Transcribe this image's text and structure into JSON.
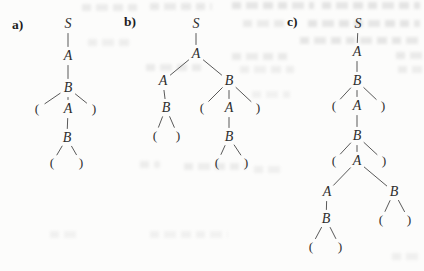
{
  "figure": {
    "type": "parse-tree-diagram",
    "description_visible": "",
    "text_color": "#2e2e2e",
    "edge_color": "#595959",
    "background_color": "#fcfcfb",
    "panels": [
      {
        "label": "a)",
        "tree": {
          "nodes": [
            {
              "id": "n1",
              "label": "S",
              "x": 68,
              "y": 24,
              "parent": ""
            },
            {
              "id": "n2",
              "label": "A",
              "x": 68,
              "y": 56,
              "parent": "n1"
            },
            {
              "id": "n3",
              "label": "B",
              "x": 68,
              "y": 88,
              "parent": "n2"
            },
            {
              "id": "n4",
              "label": "(",
              "x": 37,
              "y": 109,
              "parent": "n3"
            },
            {
              "id": "n5",
              "label": "A",
              "x": 68,
              "y": 109,
              "parent": "n3"
            },
            {
              "id": "n6",
              "label": ")",
              "x": 94,
              "y": 109,
              "parent": "n3"
            },
            {
              "id": "n7",
              "label": "B",
              "x": 67,
              "y": 138,
              "parent": "n5"
            },
            {
              "id": "n8",
              "label": "(",
              "x": 52,
              "y": 163,
              "parent": "n7"
            },
            {
              "id": "n9",
              "label": ")",
              "x": 81,
              "y": 163,
              "parent": "n7"
            }
          ]
        }
      },
      {
        "label": "b)",
        "tree": {
          "nodes": [
            {
              "id": "n1",
              "label": "S",
              "x": 196,
              "y": 24,
              "parent": ""
            },
            {
              "id": "n2",
              "label": "A",
              "x": 196,
              "y": 54,
              "parent": "n1"
            },
            {
              "id": "n3",
              "label": "A",
              "x": 163,
              "y": 81,
              "parent": "n2"
            },
            {
              "id": "n4",
              "label": "B",
              "x": 229,
              "y": 81,
              "parent": "n2"
            },
            {
              "id": "n5",
              "label": "B",
              "x": 166,
              "y": 108,
              "parent": "n3"
            },
            {
              "id": "n6",
              "label": "(",
              "x": 155,
              "y": 136,
              "parent": "n5"
            },
            {
              "id": "n7",
              "label": ")",
              "x": 178,
              "y": 136,
              "parent": "n5"
            },
            {
              "id": "n8",
              "label": "(",
              "x": 202,
              "y": 108,
              "parent": "n4"
            },
            {
              "id": "n9",
              "label": "A",
              "x": 229,
              "y": 108,
              "parent": "n4"
            },
            {
              "id": "n10",
              "label": ")",
              "x": 258,
              "y": 108,
              "parent": "n4"
            },
            {
              "id": "n11",
              "label": "B",
              "x": 229,
              "y": 137,
              "parent": "n9"
            },
            {
              "id": "n12",
              "label": "(",
              "x": 217,
              "y": 163,
              "parent": "n11"
            },
            {
              "id": "n13",
              "label": ")",
              "x": 246,
              "y": 163,
              "parent": "n11"
            }
          ]
        }
      },
      {
        "label": "c)",
        "tree": {
          "nodes": [
            {
              "id": "n1",
              "label": "S",
              "x": 358,
              "y": 24,
              "parent": ""
            },
            {
              "id": "n2",
              "label": "A",
              "x": 357,
              "y": 52,
              "parent": "n1"
            },
            {
              "id": "n3",
              "label": "B",
              "x": 357,
              "y": 81,
              "parent": "n2"
            },
            {
              "id": "n4",
              "label": "(",
              "x": 334,
              "y": 106,
              "parent": "n3"
            },
            {
              "id": "n5",
              "label": "A",
              "x": 357,
              "y": 106,
              "parent": "n3"
            },
            {
              "id": "n6",
              "label": ")",
              "x": 383,
              "y": 106,
              "parent": "n3"
            },
            {
              "id": "n7",
              "label": "B",
              "x": 357,
              "y": 136,
              "parent": "n5"
            },
            {
              "id": "n8",
              "label": "(",
              "x": 334,
              "y": 161,
              "parent": "n7"
            },
            {
              "id": "n9",
              "label": "A",
              "x": 357,
              "y": 161,
              "parent": "n7"
            },
            {
              "id": "n10",
              "label": ")",
              "x": 384,
              "y": 161,
              "parent": "n7"
            },
            {
              "id": "n11",
              "label": "A",
              "x": 327,
              "y": 192,
              "parent": "n9"
            },
            {
              "id": "n12",
              "label": "B",
              "x": 394,
              "y": 192,
              "parent": "n9"
            },
            {
              "id": "n13",
              "label": "B",
              "x": 326,
              "y": 219,
              "parent": "n11"
            },
            {
              "id": "n14",
              "label": "(",
              "x": 311,
              "y": 247,
              "parent": "n13"
            },
            {
              "id": "n15",
              "label": ")",
              "x": 340,
              "y": 247,
              "parent": "n13"
            },
            {
              "id": "n16",
              "label": "(",
              "x": 381,
              "y": 220,
              "parent": "n12"
            },
            {
              "id": "n17",
              "label": ")",
              "x": 409,
              "y": 220,
              "parent": "n12"
            }
          ]
        }
      }
    ]
  }
}
